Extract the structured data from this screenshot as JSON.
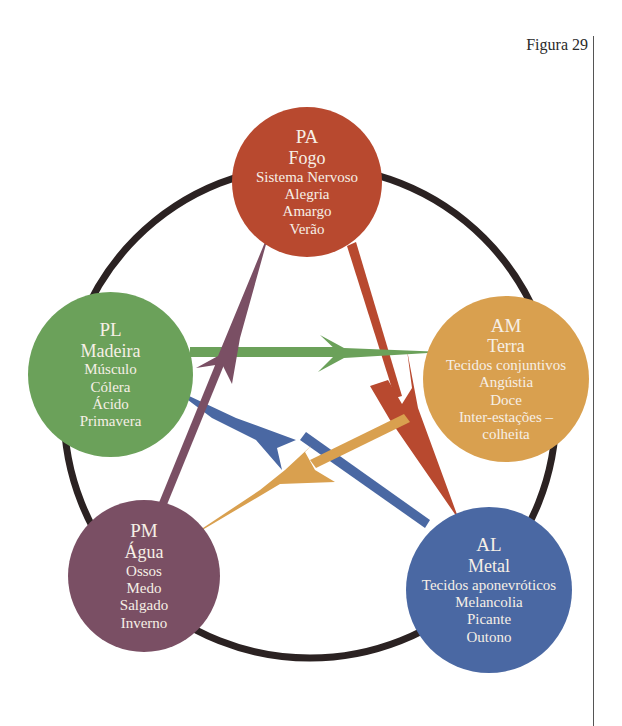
{
  "figure_label": "Figura 29",
  "colors": {
    "fire": "#b8492f",
    "wood": "#6ba15a",
    "earth": "#d9a04f",
    "water": "#7a4f64",
    "metal": "#4a68a3",
    "ring": "#2b2222",
    "text": "#f6efe6"
  },
  "nodes": [
    {
      "id": "PA",
      "abbr": "PA",
      "element": "Fogo",
      "lines": [
        "Sistema Nervoso",
        "Alegria",
        "Amargo",
        "Verão"
      ]
    },
    {
      "id": "PL",
      "abbr": "PL",
      "element": "Madeira",
      "lines": [
        "Músculo",
        "Cólera",
        "Ácido",
        "Primavera"
      ]
    },
    {
      "id": "AM",
      "abbr": "AM",
      "element": "Terra",
      "lines": [
        "Tecidos conjuntivos",
        "Angústia",
        "Doce",
        "Inter-estações –",
        "colheita"
      ]
    },
    {
      "id": "PM",
      "abbr": "PM",
      "element": "Água",
      "lines": [
        "Ossos",
        "Medo",
        "Salgado",
        "Inverno"
      ]
    },
    {
      "id": "AL",
      "abbr": "AL",
      "element": "Metal",
      "lines": [
        "Tecidos aponevróticos",
        "Melancolia",
        "Picante",
        "Outono"
      ]
    }
  ],
  "arrows": [
    {
      "from": "PA",
      "to": "AL",
      "color": "fire"
    },
    {
      "from": "PL",
      "to": "AM",
      "color": "wood"
    },
    {
      "from": "AL",
      "to": "PL",
      "color": "metal"
    },
    {
      "from": "AM",
      "to": "PM",
      "color": "earth"
    },
    {
      "from": "PM",
      "to": "PA",
      "color": "water"
    }
  ]
}
